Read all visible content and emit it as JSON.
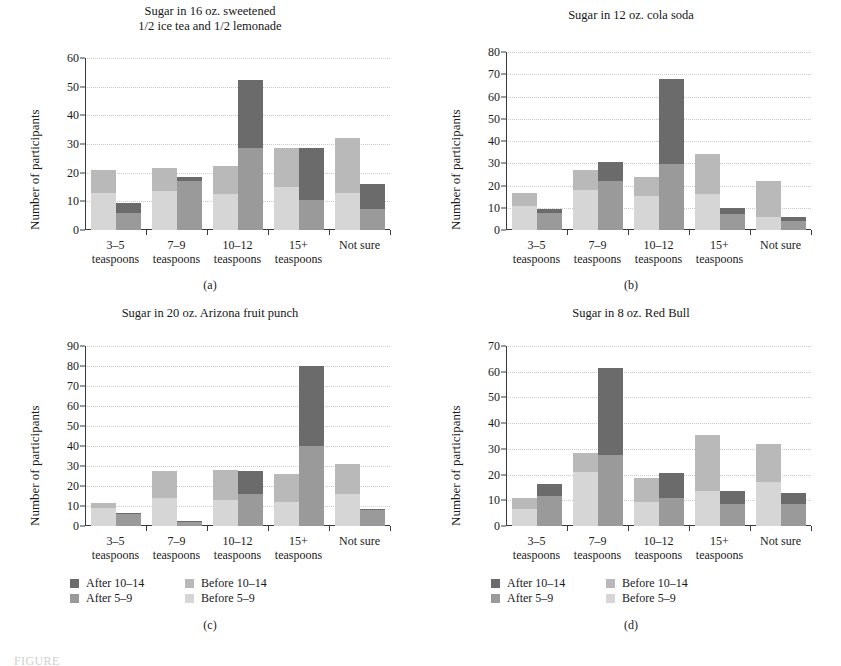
{
  "figure": {
    "caption_partial": "FIGURE"
  },
  "legend": {
    "series": [
      {
        "key": "after_10_14",
        "label": "After 10–14",
        "color": "#6b6b6b"
      },
      {
        "key": "after_5_9",
        "label": "After 5–9",
        "color": "#9a9a9a"
      },
      {
        "key": "before_10_14",
        "label": "Before 10–14",
        "color": "#b9b9b9"
      },
      {
        "key": "before_5_9",
        "label": "Before 5–9",
        "color": "#d6d6d6"
      }
    ]
  },
  "categories": [
    {
      "line1": "3–5",
      "line2": "teaspoons"
    },
    {
      "line1": "7–9",
      "line2": "teaspoons"
    },
    {
      "line1": "10–12",
      "line2": "teaspoons"
    },
    {
      "line1": "15+",
      "line2": "teaspoons"
    },
    {
      "line1": "Not sure",
      "line2": ""
    }
  ],
  "axis": {
    "ylabel": "Number of participants"
  },
  "chart_data": [
    {
      "id": "a",
      "sublabel": "(a)",
      "type": "bar",
      "title": "Sugar in 16 oz. sweetened\n1/2 ice tea and 1/2 lemonade",
      "title_lines": [
        "Sugar in 16 oz. sweetened",
        "1/2 ice tea and 1/2 lemonade"
      ],
      "xlabel": "",
      "ylabel": "Number of participants",
      "ylim": [
        0,
        60
      ],
      "ytick_step": 10,
      "yticks": [
        0,
        10,
        20,
        30,
        40,
        50,
        60
      ],
      "grid": true,
      "legend_position": "none",
      "categories": [
        "3–5 teaspoons",
        "7–9 teaspoons",
        "10–12 teaspoons",
        "15+ teaspoons",
        "Not sure"
      ],
      "series": [
        {
          "name": "Before 5–9",
          "values": [
            13,
            13.5,
            12.5,
            15,
            13
          ]
        },
        {
          "name": "Before 10–14",
          "values": [
            8,
            8,
            10,
            13.5,
            19
          ]
        },
        {
          "name": "After 5–9",
          "values": [
            6,
            17,
            28.5,
            10.5,
            7.5
          ]
        },
        {
          "name": "After 10–14",
          "values": [
            3.5,
            1.5,
            24,
            18,
            8.5
          ]
        }
      ],
      "bar_totals": {
        "before": [
          21,
          21.5,
          22.5,
          28.5,
          32
        ],
        "after": [
          9.5,
          18.5,
          52.5,
          28.5,
          16
        ]
      }
    },
    {
      "id": "b",
      "sublabel": "(b)",
      "type": "bar",
      "title": "Sugar in 12 oz. cola soda",
      "title_lines": [
        "Sugar in 12 oz. cola soda"
      ],
      "xlabel": "",
      "ylabel": "Number of participants",
      "ylim": [
        0,
        80
      ],
      "ytick_step": 10,
      "yticks": [
        0,
        10,
        20,
        30,
        40,
        50,
        60,
        70,
        80
      ],
      "grid": true,
      "legend_position": "none",
      "categories": [
        "3–5 teaspoons",
        "7–9 teaspoons",
        "10–12 teaspoons",
        "15+ teaspoons",
        "Not sure"
      ],
      "series": [
        {
          "name": "Before 5–9",
          "values": [
            11,
            18,
            15.5,
            16,
            6
          ]
        },
        {
          "name": "Before 10–14",
          "values": [
            5.5,
            9,
            8.5,
            18,
            16
          ]
        },
        {
          "name": "After 5–9",
          "values": [
            7.5,
            22,
            29.5,
            7,
            4
          ]
        },
        {
          "name": "After 10–14",
          "values": [
            2,
            8.5,
            38.5,
            3,
            2
          ]
        }
      ],
      "bar_totals": {
        "before": [
          16.5,
          27,
          24,
          34,
          22
        ],
        "after": [
          9.5,
          30.5,
          68,
          10,
          6
        ]
      }
    },
    {
      "id": "c",
      "sublabel": "(c)",
      "type": "bar",
      "title": "Sugar in 20 oz. Arizona fruit punch",
      "title_lines": [
        "Sugar in 20 oz. Arizona fruit punch"
      ],
      "xlabel": "",
      "ylabel": "Number of participants",
      "ylim": [
        0,
        90
      ],
      "ytick_step": 10,
      "yticks": [
        0,
        10,
        20,
        30,
        40,
        50,
        60,
        70,
        80,
        90
      ],
      "grid": true,
      "legend_position": "bottom",
      "categories": [
        "3–5 teaspoons",
        "7–9 teaspoons",
        "10–12 teaspoons",
        "15+ teaspoons",
        "Not sure"
      ],
      "series": [
        {
          "name": "Before 5–9",
          "values": [
            9,
            14,
            13,
            12,
            16
          ]
        },
        {
          "name": "Before 10–14",
          "values": [
            2.5,
            13.5,
            15,
            14,
            15
          ]
        },
        {
          "name": "After 5–9",
          "values": [
            6,
            2,
            16,
            40,
            8
          ]
        },
        {
          "name": "After 10–14",
          "values": [
            0.5,
            0.5,
            11.5,
            40,
            0.5
          ]
        }
      ],
      "bar_totals": {
        "before": [
          11.5,
          27.5,
          28,
          26,
          31
        ],
        "after": [
          6.5,
          2.5,
          27.5,
          80,
          8.5
        ]
      }
    },
    {
      "id": "d",
      "sublabel": "(d)",
      "type": "bar",
      "title": "Sugar in 8 oz. Red Bull",
      "title_lines": [
        "Sugar in 8 oz. Red Bull"
      ],
      "xlabel": "",
      "ylabel": "Number of participants",
      "ylim": [
        0,
        70
      ],
      "ytick_step": 10,
      "yticks": [
        0,
        10,
        20,
        30,
        40,
        50,
        60,
        70
      ],
      "grid": true,
      "legend_position": "bottom",
      "categories": [
        "3–5 teaspoons",
        "7–9 teaspoons",
        "10–12 teaspoons",
        "15+ teaspoons",
        "Not sure"
      ],
      "series": [
        {
          "name": "Before 5–9",
          "values": [
            6.5,
            21,
            9.5,
            13.5,
            17
          ]
        },
        {
          "name": "Before 10–14",
          "values": [
            4.5,
            7.5,
            9,
            22,
            15
          ]
        },
        {
          "name": "After 5–9",
          "values": [
            11.5,
            27.5,
            11,
            8.5,
            8.5
          ]
        },
        {
          "name": "After 10–14",
          "values": [
            5,
            34,
            9.5,
            5,
            4.5
          ]
        }
      ],
      "bar_totals": {
        "before": [
          11,
          28.5,
          18.5,
          35.5,
          32
        ],
        "after": [
          16.5,
          61.5,
          20.5,
          13.5,
          13
        ]
      }
    }
  ]
}
